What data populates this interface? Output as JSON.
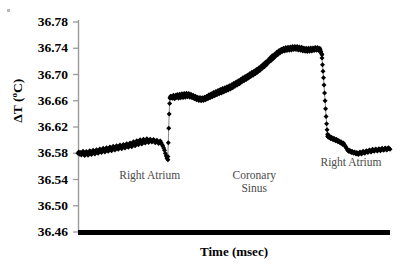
{
  "chart_data": {
    "type": "scatter",
    "title": "",
    "xlabel": "Time (msec)",
    "ylabel": "ΔT (ºC)",
    "ylim": [
      36.46,
      36.78
    ],
    "yticks": [
      "36.46",
      "36.50",
      "36.54",
      "36.58",
      "36.62",
      "36.66",
      "36.70",
      "36.74",
      "36.78"
    ],
    "ytick_values": [
      36.46,
      36.5,
      36.54,
      36.58,
      36.62,
      36.66,
      36.7,
      36.74,
      36.78
    ],
    "xticks": [],
    "xtick_labels": [],
    "grid": false,
    "legend": false,
    "marker_color": "#000000",
    "axis_color": "#000000",
    "background": "#ffffff",
    "annotations": [
      {
        "text": "Right Atrium",
        "x_frac": 0.23,
        "y_value": 36.545
      },
      {
        "text": "Coronary\nSinus",
        "x_frac": 0.565,
        "y_value": 36.545
      },
      {
        "text": "Right Atrium",
        "x_frac": 0.875,
        "y_value": 36.565
      }
    ],
    "series": [
      {
        "name": "ΔT",
        "segments": [
          {
            "phase": "Right Atrium",
            "x_start_frac": 0.0,
            "x_end_frac": 0.288,
            "values": [
              36.58,
              36.582,
              36.5785,
              36.581,
              36.5775,
              36.5805,
              36.583,
              36.579,
              36.5765,
              36.58,
              36.5825,
              36.5795,
              36.577,
              36.5815,
              36.584,
              36.58,
              36.578,
              36.582,
              36.5845,
              36.581,
              36.579,
              36.583,
              36.5855,
              36.582,
              36.58,
              36.584,
              36.5865,
              36.583,
              36.581,
              36.585,
              36.5875,
              36.584,
              36.582,
              36.586,
              36.5885,
              36.585,
              36.583,
              36.587,
              36.5895,
              36.586,
              36.584,
              36.588,
              36.5905,
              36.587,
              36.585,
              36.589,
              36.5915,
              36.588,
              36.586,
              36.59,
              36.5925,
              36.589,
              36.587,
              36.591,
              36.5935,
              36.59,
              36.588,
              36.592,
              36.5945,
              36.591,
              36.589,
              36.593,
              36.5955,
              36.592,
              36.59,
              36.5945,
              36.5975,
              36.594,
              36.5915,
              36.596,
              36.599,
              36.5955,
              36.593,
              36.5975,
              36.6005,
              36.5965,
              36.594,
              36.5985,
              36.6015,
              36.5975,
              36.5955,
              36.5995,
              36.602,
              36.5985,
              36.5965,
              36.6,
              36.6015,
              36.599,
              36.597,
              36.5995,
              36.601,
              36.5985,
              36.596,
              36.5985,
              36.6,
              36.5975,
              36.595,
              36.597,
              36.5985,
              36.596,
              36.5935,
              36.591,
              36.588,
              36.5845,
              36.58,
              36.576,
              36.5725,
              36.57
            ]
          },
          {
            "phase": "transition-up",
            "x_start_frac": 0.288,
            "x_end_frac": 0.295,
            "values": [
              36.575,
              36.596,
              36.618,
              36.64,
              36.656,
              36.664
            ]
          },
          {
            "phase": "Coronary Sinus",
            "x_start_frac": 0.295,
            "x_end_frac": 0.782,
            "values": [
              36.665,
              36.667,
              36.6645,
              36.6665,
              36.664,
              36.666,
              36.6685,
              36.6655,
              36.663,
              36.666,
              36.6685,
              36.665,
              36.667,
              36.6695,
              36.666,
              36.664,
              36.6675,
              36.67,
              36.6665,
              36.6645,
              36.668,
              36.6705,
              36.667,
              36.665,
              36.6685,
              36.671,
              36.6675,
              36.6655,
              36.669,
              36.6715,
              36.668,
              36.666,
              36.669,
              36.671,
              36.668,
              36.6655,
              36.668,
              36.67,
              36.667,
              36.6645,
              36.6665,
              36.6685,
              36.6655,
              36.663,
              36.665,
              36.667,
              36.664,
              36.6615,
              36.6635,
              36.6655,
              36.6625,
              36.6605,
              36.6625,
              36.665,
              36.662,
              36.66,
              36.662,
              36.6645,
              36.662,
              36.6605,
              36.663,
              36.6655,
              36.663,
              36.6615,
              36.6645,
              36.667,
              36.6645,
              36.663,
              36.666,
              36.669,
              36.666,
              36.6645,
              36.6675,
              36.6705,
              36.6675,
              36.666,
              36.6695,
              36.6725,
              36.6695,
              36.6675,
              36.671,
              36.674,
              36.671,
              36.669,
              36.6725,
              36.6755,
              36.6725,
              36.6705,
              36.674,
              36.677,
              36.674,
              36.672,
              36.6755,
              36.6785,
              36.6755,
              36.6735,
              36.677,
              36.68,
              36.677,
              36.675,
              36.6785,
              36.6815,
              36.679,
              36.6765,
              36.68,
              36.683,
              36.6805,
              36.678,
              36.6815,
              36.6845,
              36.682,
              36.68,
              36.6835,
              36.6865,
              36.684,
              36.682,
              36.6855,
              36.6885,
              36.686,
              36.684,
              36.6875,
              36.6905,
              36.688,
              36.686,
              36.6895,
              36.6925,
              36.69,
              36.6885,
              36.692,
              36.695,
              36.6925,
              36.6905,
              36.694,
              36.697,
              36.6945,
              36.6925,
              36.696,
              36.699,
              36.6965,
              36.6945,
              36.698,
              36.701,
              36.6985,
              36.697,
              36.7005,
              36.7035,
              36.701,
              36.699,
              36.7025,
              36.7055,
              36.703,
              36.701,
              36.7045,
              36.7075,
              36.7055,
              36.7035,
              36.707,
              36.71,
              36.708,
              36.706,
              36.7095,
              36.7125,
              36.7105,
              36.709,
              36.7125,
              36.7155,
              36.7135,
              36.712,
              36.7155,
              36.7185,
              36.7165,
              36.715,
              36.7185,
              36.7215,
              36.72,
              36.7185,
              36.722,
              36.725,
              36.7235,
              36.7215,
              36.725,
              36.7285,
              36.7265,
              36.7245,
              36.728,
              36.731,
              36.73,
              36.728,
              36.731,
              36.734,
              36.7325,
              36.7305,
              36.7335,
              36.7365,
              36.735,
              36.733,
              36.7355,
              36.7385,
              36.737,
              36.735,
              36.7375,
              36.74,
              36.7385,
              36.736,
              36.7385,
              36.741,
              36.739,
              36.7365,
              36.739,
              36.7415,
              36.7395,
              36.737,
              36.7395,
              36.742,
              36.74,
              36.7375,
              36.74,
              36.7425,
              36.7405,
              36.738,
              36.7405,
              36.7425,
              36.74,
              36.738,
              36.7405,
              36.7425,
              36.74,
              36.7375,
              36.74,
              36.742,
              36.7395,
              36.737,
              36.7395,
              36.7415,
              36.739,
              36.736,
              36.7385,
              36.7405,
              36.738,
              36.7355,
              36.738,
              36.74,
              36.7375,
              36.735,
              36.7375,
              36.74,
              36.738,
              36.7355,
              36.738,
              36.7405,
              36.7385,
              36.736,
              36.7385,
              36.7405,
              36.7385,
              36.7365,
              36.739,
              36.741,
              36.739,
              36.737,
              36.739,
              36.741,
              36.739,
              36.7365,
              36.7385,
              36.74,
              36.7375,
              36.7345,
              36.732,
              36.73
            ]
          },
          {
            "phase": "transition-down",
            "x_start_frac": 0.782,
            "x_end_frac": 0.8,
            "values": [
              36.725,
              36.715,
              36.705,
              36.695,
              36.684,
              36.672,
              36.66,
              36.648,
              36.636,
              36.625,
              36.616,
              36.609
            ]
          },
          {
            "phase": "Right Atrium",
            "x_start_frac": 0.8,
            "x_end_frac": 1.0,
            "values": [
              36.606,
              36.6045,
              36.6065,
              36.604,
              36.602,
              36.6045,
              36.6025,
              36.6005,
              36.603,
              36.601,
              36.599,
              36.6015,
              36.5995,
              36.5975,
              36.5995,
              36.5975,
              36.5955,
              36.5975,
              36.5955,
              36.5935,
              36.5955,
              36.5935,
              36.5915,
              36.5895,
              36.5875,
              36.5855,
              36.584,
              36.5825,
              36.5845,
              36.5825,
              36.581,
              36.583,
              36.5815,
              36.58,
              36.582,
              36.5805,
              36.579,
              36.581,
              36.5795,
              36.578,
              36.58,
              36.582,
              36.5805,
              36.579,
              36.581,
              36.583,
              36.5815,
              36.58,
              36.582,
              36.584,
              36.5825,
              36.581,
              36.583,
              36.585,
              36.5835,
              36.582,
              36.584,
              36.586,
              36.5845,
              36.583,
              36.585,
              36.5865,
              36.585,
              36.5835,
              36.5855,
              36.587,
              36.5855,
              36.584,
              36.586,
              36.5875,
              36.586,
              36.5845,
              36.5865,
              36.588,
              36.5865,
              36.585,
              36.587,
              36.5885,
              36.587,
              36.586
            ]
          }
        ]
      }
    ]
  },
  "axes": {
    "y_axis_color": "#9a9a9a",
    "x_axis_color": "#000000"
  }
}
